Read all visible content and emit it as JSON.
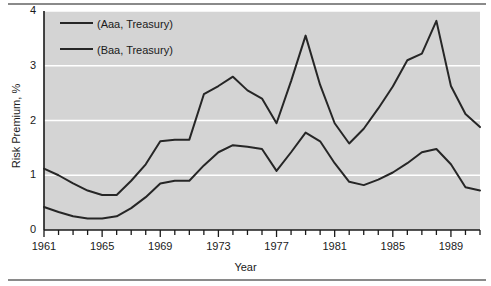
{
  "chart_data": {
    "type": "line",
    "title": "",
    "xlabel": "Year",
    "ylabel": "Risk Premium, %",
    "xlim": [
      1961,
      1991
    ],
    "ylim": [
      0,
      4
    ],
    "yticks": [
      0,
      1,
      2,
      3,
      4
    ],
    "ytick_labels": [
      "0",
      "1",
      "2",
      "3",
      "4"
    ],
    "xticks": [
      1961,
      1965,
      1969,
      1973,
      1977,
      1981,
      1985,
      1989
    ],
    "xtick_labels": [
      "1961",
      "1965",
      "1969",
      "1973",
      "1977",
      "1981",
      "1985",
      "1989"
    ],
    "xtick_minor_step": 1,
    "grid": "horizontal-white-gridlines",
    "plot_background": "#d4d4d4",
    "line_color": "#262626",
    "gridline_color": "#ffffff",
    "legend_position": "top-left-inside",
    "x": [
      1961,
      1962,
      1963,
      1964,
      1965,
      1966,
      1967,
      1968,
      1969,
      1970,
      1971,
      1972,
      1973,
      1974,
      1975,
      1976,
      1977,
      1978,
      1979,
      1980,
      1981,
      1982,
      1983,
      1984,
      1985,
      1986,
      1987,
      1988,
      1989,
      1990,
      1991
    ],
    "series": [
      {
        "name": "(Baa, Treasury)",
        "legend_label": "(Baa, Treasury)",
        "values": [
          1.12,
          1.0,
          0.85,
          0.72,
          0.64,
          0.64,
          0.9,
          1.2,
          1.62,
          1.65,
          1.65,
          2.48,
          2.63,
          2.8,
          2.55,
          2.4,
          1.95,
          2.72,
          3.55,
          2.65,
          1.95,
          1.58,
          1.85,
          2.22,
          2.62,
          3.1,
          3.22,
          3.82,
          2.63,
          2.12,
          1.88
        ],
        "color": "#262626"
      },
      {
        "name": "(Aaa, Treasury)",
        "legend_label": "(Aaa, Treasury)",
        "values": [
          0.42,
          0.33,
          0.25,
          0.21,
          0.21,
          0.25,
          0.4,
          0.6,
          0.85,
          0.9,
          0.9,
          1.18,
          1.42,
          1.55,
          1.52,
          1.48,
          1.08,
          1.42,
          1.78,
          1.62,
          1.22,
          0.88,
          0.82,
          0.92,
          1.05,
          1.22,
          1.42,
          1.48,
          1.2,
          0.78,
          0.72
        ],
        "color": "#262626"
      }
    ]
  },
  "axes": {
    "ylabel": "Risk Premium, %",
    "xlabel": "Year"
  },
  "legend": {
    "entries": [
      {
        "label": "(Aaa, Treasury)"
      },
      {
        "label": "(Baa, Treasury)"
      }
    ]
  }
}
